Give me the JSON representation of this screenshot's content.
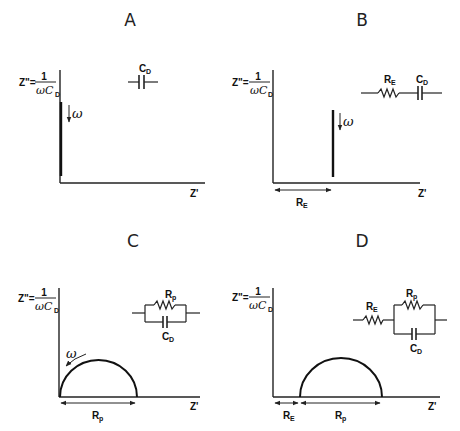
{
  "figure": {
    "panels": [
      {
        "id": "A",
        "title": "A",
        "y_axis_label": {
          "lhs": "Z\"=",
          "num": "1",
          "den": "ωC",
          "den_sub": "D"
        },
        "x_axis_label": "Z'",
        "frequency_label": "ω",
        "circuit": {
          "description": "single capacitor",
          "labels": {
            "C": "C",
            "C_sub": "D"
          }
        },
        "plot": "vertical line along imaginary axis at Z'=0"
      },
      {
        "id": "B",
        "title": "B",
        "y_axis_label": {
          "lhs": "Z\"=",
          "num": "1",
          "den": "ωC",
          "den_sub": "D"
        },
        "x_axis_label": "Z'",
        "frequency_label": "ω",
        "dimension_label": {
          "main": "R",
          "sub": "E"
        },
        "circuit": {
          "description": "resistor RE in series with capacitor CD",
          "labels": {
            "R": "R",
            "R_sub": "E",
            "C": "C",
            "C_sub": "D"
          }
        },
        "plot": "vertical line offset at Z'=RE"
      },
      {
        "id": "C",
        "title": "C",
        "y_axis_label": {
          "lhs": "Z\"=",
          "num": "1",
          "den": "ωC",
          "den_sub": "D"
        },
        "x_axis_label": "Z'",
        "frequency_label": "ω",
        "dimension_label": {
          "main": "R",
          "sub": "p"
        },
        "circuit": {
          "description": "resistor Rp in parallel with capacitor CD",
          "labels": {
            "R": "R",
            "R_sub": "p",
            "C": "C",
            "C_sub": "D"
          }
        },
        "plot": "semicircle from 0 to Rp"
      },
      {
        "id": "D",
        "title": "D",
        "y_axis_label": {
          "lhs": "Z\"=",
          "num": "1",
          "den": "ωC",
          "den_sub": "D"
        },
        "x_axis_label": "Z'",
        "dimension_labels": [
          {
            "main": "R",
            "sub": "E"
          },
          {
            "main": "R",
            "sub": "p"
          }
        ],
        "circuit": {
          "description": "resistor RE in series with (Rp parallel CD)",
          "labels": {
            "RE": "R",
            "RE_sub": "E",
            "Rp": "R",
            "Rp_sub": "p",
            "C": "C",
            "C_sub": "D"
          }
        },
        "plot": "semicircle from RE to RE+Rp"
      }
    ]
  }
}
